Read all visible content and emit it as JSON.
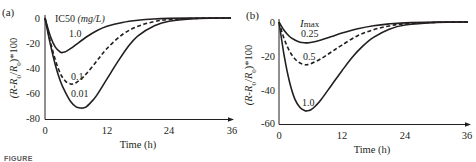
{
  "figure": {
    "caption_fragment": "FIGURE"
  },
  "panels": [
    {
      "label": "(a)",
      "legend_title": "IC50",
      "legend_unit": "(mg/L)",
      "ylabel": "(R-R0/R0)*100",
      "xlabel": "Time (h)",
      "xticks": [
        "0",
        "12",
        "24",
        "36"
      ],
      "yticks": [
        "0",
        "-20",
        "-40",
        "-60",
        "-80"
      ],
      "curve_labels": [
        "1.0",
        "0.1",
        "0.01"
      ]
    },
    {
      "label": "(b)",
      "legend_title": "Imax",
      "ylabel": "(R-R0/R0)*100",
      "xlabel": "Time (h)",
      "xticks": [
        "0",
        "12",
        "24",
        "36"
      ],
      "yticks": [
        "0",
        "-20",
        "-40",
        "-60"
      ],
      "curve_labels": [
        "0.25",
        "0.5",
        "1.0"
      ]
    }
  ],
  "chart_data": [
    {
      "type": "line",
      "title": "(a)",
      "xlabel": "Time (h)",
      "ylabel": "(R-R0/R0)*100",
      "xlim": [
        0,
        36
      ],
      "ylim": [
        -80,
        0
      ],
      "xticks": [
        0,
        12,
        24,
        36
      ],
      "yticks": [
        0,
        -20,
        -40,
        -60,
        -80
      ],
      "grid": false,
      "legend": {
        "title": "IC50 (mg/L)",
        "position": "inline-labels"
      },
      "series": [
        {
          "name": "1.0",
          "style": "solid",
          "x": [
            0,
            1,
            2,
            3,
            3.5,
            4,
            5,
            6,
            8,
            10,
            12,
            15,
            18,
            21,
            24,
            30,
            36
          ],
          "y": [
            0,
            -14,
            -23,
            -27,
            -27,
            -26.5,
            -24,
            -21,
            -15,
            -10,
            -6.5,
            -3.5,
            -1.8,
            -0.8,
            -0.3,
            0,
            0
          ]
        },
        {
          "name": "0.1",
          "style": "dashed",
          "x": [
            0,
            1,
            2,
            3,
            4,
            5,
            5.4,
            6,
            7,
            8,
            10,
            12,
            15,
            18,
            21,
            24,
            30,
            36
          ],
          "y": [
            0,
            -18,
            -33,
            -44,
            -50,
            -52,
            -52,
            -51,
            -48,
            -44,
            -34,
            -24,
            -13,
            -6.5,
            -3,
            -1.2,
            -0.2,
            0
          ]
        },
        {
          "name": "0.01",
          "style": "solid",
          "x": [
            0,
            1,
            2,
            3,
            4,
            5,
            6,
            7,
            7.2,
            8,
            9,
            10,
            12,
            14,
            16,
            18,
            21,
            24,
            30,
            36
          ],
          "y": [
            0,
            -20,
            -37,
            -50,
            -59,
            -66,
            -70,
            -71,
            -71,
            -70,
            -66,
            -61,
            -48,
            -35,
            -23,
            -14,
            -6.5,
            -2.5,
            -0.4,
            0
          ]
        }
      ]
    },
    {
      "type": "line",
      "title": "(b)",
      "xlabel": "Time (h)",
      "ylabel": "(R-R0/R0)*100",
      "xlim": [
        0,
        36
      ],
      "ylim": [
        -60,
        0
      ],
      "xticks": [
        0,
        12,
        24,
        36
      ],
      "yticks": [
        0,
        -20,
        -40,
        -60
      ],
      "grid": false,
      "legend": {
        "title": "Imax",
        "position": "inline-labels"
      },
      "series": [
        {
          "name": "0.25",
          "style": "solid",
          "x": [
            0,
            1,
            2,
            3,
            4,
            5,
            5.3,
            6,
            8,
            10,
            12,
            15,
            18,
            21,
            24,
            30,
            36
          ],
          "y": [
            0,
            -5,
            -8.5,
            -10.5,
            -11.8,
            -12.2,
            -12.2,
            -12,
            -10.5,
            -8.5,
            -6.5,
            -4,
            -2.2,
            -1.1,
            -0.5,
            -0.1,
            0
          ]
        },
        {
          "name": "0.5",
          "style": "dashed",
          "x": [
            0,
            1,
            2,
            3,
            4,
            5,
            5.3,
            6,
            8,
            10,
            12,
            15,
            18,
            21,
            24,
            30,
            36
          ],
          "y": [
            0,
            -10,
            -17,
            -21.5,
            -24,
            -25,
            -25,
            -24.5,
            -21.5,
            -17.5,
            -13.5,
            -8,
            -4.5,
            -2.3,
            -1,
            -0.2,
            0
          ]
        },
        {
          "name": "1.0",
          "style": "solid",
          "x": [
            0,
            1,
            2,
            3,
            4,
            5,
            5.3,
            6,
            7,
            8,
            10,
            12,
            14,
            16,
            18,
            21,
            24,
            30,
            36
          ],
          "y": [
            0,
            -20,
            -35,
            -45,
            -50,
            -52,
            -52,
            -51.5,
            -49,
            -45.5,
            -37,
            -28.5,
            -20.5,
            -14,
            -9,
            -4.2,
            -1.8,
            -0.3,
            0
          ]
        }
      ]
    }
  ]
}
